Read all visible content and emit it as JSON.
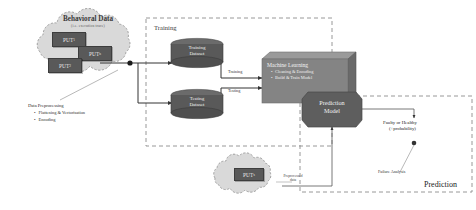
{
  "diagram": {
    "colors": {
      "cloud_fill": "#d9d9d9",
      "cloud_stroke": "#8c8c8c",
      "box_dark": "#595959",
      "ml_box": "#7f7f7f",
      "cylinder": "#595959",
      "prediction_model": "#5e5e5e",
      "dashed_border": "#8c8c8c",
      "connector": "#3f3f3f"
    }
  },
  "top_cloud": {
    "title": "Behavioral Data",
    "subtitle": "(i.e. execution trace)",
    "items": [
      {
        "label": "PUT",
        "subscript": "1"
      },
      {
        "label": "PUT",
        "subscript": "n"
      },
      {
        "label": "PUT",
        "subscript": "2"
      }
    ]
  },
  "preprocessing": {
    "title": "Data Preprocessing",
    "bullets": [
      "Flattening & Vectorisation",
      "Encoding"
    ]
  },
  "training_panel": {
    "label": "Training",
    "datasets": [
      {
        "line1": "Training",
        "line2": "Dataset"
      },
      {
        "line1": "Testing",
        "line2": "Dataset"
      }
    ],
    "edge_labels": [
      "Training",
      "Testing"
    ]
  },
  "ml_box": {
    "title": "Machine Learning",
    "bullets": [
      "Cleaning & Encoding",
      "Build & Train Model"
    ]
  },
  "prediction_model": {
    "line1": "Prediction",
    "line2": "Model"
  },
  "prediction_panel": {
    "label": "Prediction",
    "output": {
      "line1": "Faulty or Healthy",
      "line2": "(+probability)"
    },
    "failure_analysis": "Failure Analysis"
  },
  "bottom_cloud": {
    "items": [
      {
        "label": "PUT",
        "subscript": "x"
      }
    ],
    "note_line1": "Preprocessed",
    "note_line2": "data"
  }
}
